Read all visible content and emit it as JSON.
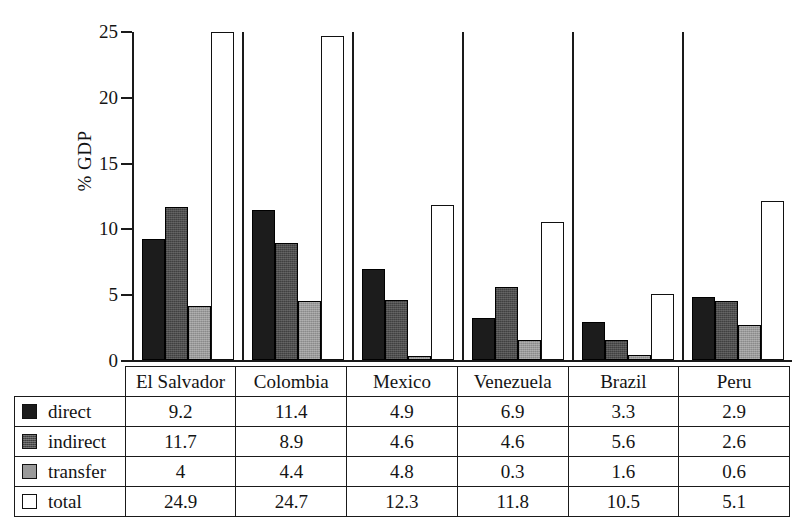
{
  "chart_data": {
    "type": "bar",
    "title": "",
    "xlabel": "",
    "ylabel": "% GDP",
    "ylim": [
      0,
      25
    ],
    "yticks": [
      0,
      5,
      10,
      15,
      20,
      25
    ],
    "grid": false,
    "legend_position": "table-left",
    "categories": [
      "El Salvador",
      "Colombia",
      "Mexico",
      "Venezuela",
      "Brazil",
      "Peru"
    ],
    "series": [
      {
        "name": "direct",
        "values": [
          9.2,
          11.4,
          4.9,
          6.9,
          3.3,
          2.9
        ],
        "plotted": [
          9.2,
          11.4,
          6.9,
          3.2,
          2.9,
          4.8
        ],
        "color": "#1c1c1c"
      },
      {
        "name": "indirect",
        "values": [
          11.7,
          8.9,
          4.6,
          4.6,
          5.6,
          2.6
        ],
        "plotted": [
          11.7,
          8.9,
          4.6,
          5.6,
          1.5,
          4.5
        ],
        "color": "#4e4e4e"
      },
      {
        "name": "transfer",
        "values": [
          4,
          4.4,
          4.8,
          0.3,
          1.6,
          0.6
        ],
        "plotted": [
          4.1,
          4.5,
          0.3,
          1.5,
          0.4,
          2.7
        ],
        "color": "#9a9a9a"
      },
      {
        "name": "total",
        "values": [
          24.9,
          24.7,
          12.3,
          11.8,
          10.5,
          5.1
        ],
        "plotted": [
          25.0,
          24.7,
          11.8,
          10.5,
          5.0,
          12.1
        ],
        "color": "#ffffff"
      }
    ]
  },
  "table": {
    "header": [
      "",
      "El Salvador",
      "Colombia",
      "Mexico",
      "Venezuela",
      "Brazil",
      "Peru"
    ],
    "rows": [
      {
        "label": "direct",
        "swatch": "sw0",
        "cells": [
          "9.2",
          "11.4",
          "4.9",
          "6.9",
          "3.3",
          "2.9"
        ]
      },
      {
        "label": "indirect",
        "swatch": "sw1",
        "cells": [
          "11.7",
          "8.9",
          "4.6",
          "4.6",
          "5.6",
          "2.6"
        ]
      },
      {
        "label": "transfer",
        "swatch": "sw2",
        "cells": [
          "4",
          "4.4",
          "4.8",
          "0.3",
          "1.6",
          "0.6"
        ]
      },
      {
        "label": "total",
        "swatch": "sw3",
        "cells": [
          "24.9",
          "24.7",
          "12.3",
          "11.8",
          "10.5",
          "5.1"
        ]
      }
    ]
  },
  "axis": {
    "label": "% GDP",
    "ticks": [
      "25",
      "20",
      "15",
      "10",
      "5",
      "0"
    ]
  }
}
